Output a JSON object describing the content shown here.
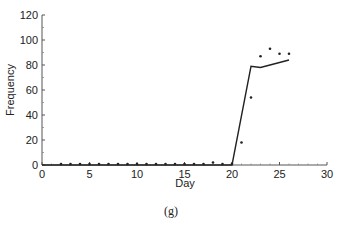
{
  "chart_data": {
    "type": "line",
    "title": "",
    "caption": "(g)",
    "xlabel": "Day",
    "ylabel": "Frequency",
    "xlim": [
      0,
      30
    ],
    "ylim": [
      0,
      120
    ],
    "xticks": [
      0,
      5,
      10,
      15,
      20,
      25,
      30
    ],
    "yticks": [
      0,
      20,
      40,
      60,
      80,
      100,
      120
    ],
    "grid": false,
    "legend": null,
    "series": [
      {
        "name": "model",
        "style": "line",
        "x": [
          0,
          20,
          22,
          23,
          24,
          25,
          26
        ],
        "y": [
          0,
          0,
          79,
          78,
          80,
          82,
          84
        ]
      },
      {
        "name": "observed",
        "style": "scatter",
        "x": [
          2,
          3,
          4,
          5,
          6,
          7,
          8,
          9,
          10,
          11,
          12,
          13,
          14,
          15,
          16,
          17,
          18,
          19,
          20,
          21,
          22,
          23,
          24,
          25,
          26
        ],
        "y": [
          0,
          0,
          0,
          0,
          0,
          0,
          0,
          0,
          0,
          0,
          0,
          0,
          0,
          0,
          0,
          0,
          2,
          0,
          1,
          18,
          54,
          87,
          93,
          89,
          89
        ]
      }
    ]
  }
}
